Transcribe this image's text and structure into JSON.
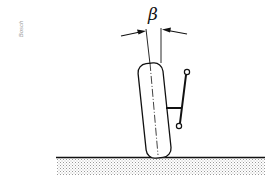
{
  "figure": {
    "credit_label": "Bosch",
    "angle_symbol": "β",
    "elements": {
      "wheel": "tilted-tire-outline",
      "steering_knuckle": "steering-arm-with-two-ball-joints",
      "ground": "road-surface-hatched",
      "dimension": "angle-beta-with-two-arrows"
    },
    "colors": {
      "line": "#111111",
      "ground_fill": "#bdbdbd",
      "background": "#ffffff",
      "credit_text": "#9a9a9a"
    }
  }
}
